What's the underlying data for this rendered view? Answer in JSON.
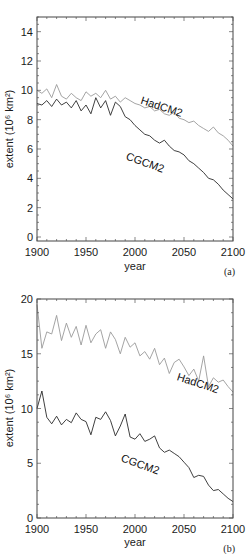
{
  "chart_data": [
    {
      "type": "line",
      "panel_label": "(a)",
      "title": "",
      "xlabel": "year",
      "ylabel": "extent (10⁶ km²)",
      "xlim": [
        1900,
        2100
      ],
      "ylim": [
        0,
        15
      ],
      "x_ticks": [
        1900,
        1950,
        2000,
        2050,
        2100
      ],
      "y_ticks": [
        0,
        2,
        4,
        6,
        8,
        10,
        12,
        14
      ],
      "grid": false,
      "legend": "inline labels",
      "x": [
        1900,
        1905,
        1910,
        1915,
        1920,
        1925,
        1930,
        1935,
        1940,
        1945,
        1950,
        1955,
        1960,
        1965,
        1970,
        1975,
        1980,
        1985,
        1990,
        1995,
        2000,
        2005,
        2010,
        2015,
        2020,
        2025,
        2030,
        2035,
        2040,
        2045,
        2050,
        2055,
        2060,
        2065,
        2070,
        2075,
        2080,
        2085,
        2090,
        2095,
        2100
      ],
      "series": [
        {
          "name": "HadCM2",
          "color": "#9a9a9a",
          "label_pos": {
            "x": 2005,
            "y": 9.1,
            "rotate": 18
          },
          "values": [
            10.0,
            9.8,
            10.1,
            9.5,
            10.4,
            9.6,
            9.4,
            9.8,
            9.5,
            9.3,
            9.9,
            9.6,
            9.8,
            9.5,
            10.0,
            9.4,
            9.6,
            9.2,
            9.5,
            9.3,
            9.1,
            9.0,
            8.8,
            8.9,
            8.6,
            8.7,
            8.4,
            8.3,
            8.5,
            8.1,
            8.0,
            7.8,
            7.9,
            7.6,
            7.4,
            7.2,
            7.5,
            7.1,
            6.9,
            6.6,
            6.2
          ]
        },
        {
          "name": "CGCM2",
          "color": "#2a2a2a",
          "label_pos": {
            "x": 1990,
            "y": 5.3,
            "rotate": 20
          },
          "values": [
            9.1,
            9.0,
            9.3,
            8.9,
            9.4,
            9.0,
            9.2,
            8.8,
            9.3,
            8.6,
            9.0,
            8.4,
            9.5,
            8.8,
            9.3,
            8.3,
            9.2,
            8.9,
            8.2,
            8.0,
            7.6,
            7.3,
            7.0,
            6.9,
            6.6,
            6.4,
            6.6,
            6.2,
            5.9,
            5.8,
            5.6,
            5.2,
            5.0,
            4.7,
            4.4,
            4.0,
            3.9,
            3.6,
            3.2,
            2.9,
            2.6
          ]
        }
      ]
    },
    {
      "type": "line",
      "panel_label": "(b)",
      "title": "",
      "xlabel": "year",
      "ylabel": "extent (10⁶ km²)",
      "xlim": [
        1900,
        2100
      ],
      "ylim": [
        0,
        20
      ],
      "x_ticks": [
        1900,
        1950,
        2000,
        2050,
        2100
      ],
      "y_ticks": [
        0,
        5,
        10,
        15,
        20
      ],
      "grid": false,
      "legend": "inline labels",
      "x": [
        1900,
        1905,
        1910,
        1915,
        1920,
        1925,
        1930,
        1935,
        1940,
        1945,
        1950,
        1955,
        1960,
        1965,
        1970,
        1975,
        1980,
        1985,
        1990,
        1995,
        2000,
        2005,
        2010,
        2015,
        2020,
        2025,
        2030,
        2035,
        2040,
        2045,
        2050,
        2055,
        2060,
        2065,
        2070,
        2075,
        2080,
        2085,
        2090,
        2095,
        2100
      ],
      "series": [
        {
          "name": "HadCM2",
          "color": "#9a9a9a",
          "label_pos": {
            "x": 2042,
            "y": 12.6,
            "rotate": 18
          },
          "values": [
            19.5,
            15.5,
            17.0,
            16.8,
            18.5,
            16.2,
            17.8,
            16.5,
            17.5,
            15.8,
            17.6,
            16.0,
            16.8,
            17.2,
            15.5,
            17.0,
            16.3,
            15.0,
            16.5,
            15.6,
            16.0,
            14.8,
            15.2,
            14.5,
            15.5,
            14.0,
            14.6,
            13.2,
            14.2,
            14.5,
            13.8,
            13.0,
            13.6,
            12.5,
            14.8,
            12.0,
            12.8,
            12.4,
            12.6,
            12.0,
            11.5
          ]
        },
        {
          "name": "CGCM2",
          "color": "#2a2a2a",
          "label_pos": {
            "x": 1985,
            "y": 5.2,
            "rotate": 20
          },
          "values": [
            10.0,
            11.6,
            9.2,
            8.6,
            9.3,
            8.5,
            9.0,
            8.7,
            9.6,
            9.0,
            8.8,
            7.6,
            9.2,
            9.0,
            9.7,
            8.9,
            7.5,
            8.4,
            9.5,
            7.4,
            7.2,
            7.7,
            7.0,
            7.2,
            7.5,
            6.4,
            6.0,
            6.2,
            5.9,
            5.6,
            5.1,
            4.6,
            3.7,
            3.9,
            3.8,
            3.0,
            2.5,
            2.6,
            2.2,
            1.8,
            1.5
          ]
        }
      ]
    }
  ]
}
